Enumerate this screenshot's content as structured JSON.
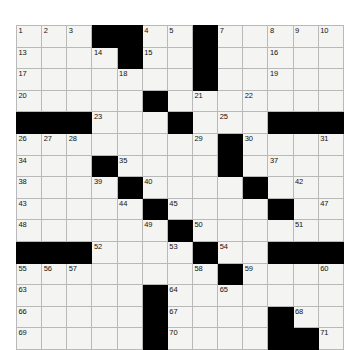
{
  "puzzle": {
    "kind": "crossword-grid",
    "title": "Crossword Puzzle Grid",
    "columns": 13,
    "rows": 15,
    "colors": {
      "block": "#000000",
      "cell": "#f4f4f2",
      "gridline": "#b9b9b9",
      "number": "#111111",
      "page_background": "#ffffff"
    },
    "legend": {
      "white_cell": ".",
      "black_cell": "#"
    },
    "grid": [
      "...##....#.....",
      "....#...#.....",
      ".....#..#.....",
      ".....#.......",
      "###....#.....",
      "........#....",
      "...#.....#...",
      "...##........",
      "....#....#.#.",
      "....#.#......",
      "###...#.#....",
      "......#.#....",
      ".....#.......",
      ".....#....#..",
      ".....#....##."
    ],
    "grid_rows": [
      {
        "row": 1,
        "blocks": [
          4,
          5,
          8
        ]
      },
      {
        "row": 2,
        "blocks": [
          5,
          8
        ]
      },
      {
        "row": 3,
        "blocks": [
          8
        ]
      },
      {
        "row": 4,
        "blocks": [
          6
        ]
      },
      {
        "row": 5,
        "blocks": [
          1,
          2,
          3,
          7,
          11,
          12,
          13
        ]
      },
      {
        "row": 6,
        "blocks": [
          9
        ]
      },
      {
        "row": 7,
        "blocks": [
          4,
          9
        ]
      },
      {
        "row": 8,
        "blocks": [
          5,
          10
        ]
      },
      {
        "row": 9,
        "blocks": [
          6,
          11
        ]
      },
      {
        "row": 10,
        "blocks": [
          7
        ]
      },
      {
        "row": 11,
        "blocks": [
          1,
          2,
          3,
          8,
          11,
          12,
          13
        ]
      },
      {
        "row": 12,
        "blocks": [
          9
        ]
      },
      {
        "row": 13,
        "blocks": [
          6
        ]
      },
      {
        "row": 14,
        "blocks": [
          6,
          11
        ]
      },
      {
        "row": 15,
        "blocks": [
          6,
          11,
          12
        ]
      }
    ],
    "numbers": [
      {
        "n": 1,
        "row": 1,
        "col": 1
      },
      {
        "n": 2,
        "row": 1,
        "col": 2
      },
      {
        "n": 3,
        "row": 1,
        "col": 3
      },
      {
        "n": 4,
        "row": 1,
        "col": 6
      },
      {
        "n": 5,
        "row": 1,
        "col": 7
      },
      {
        "n": 6,
        "row": 1,
        "col": 8
      },
      {
        "n": 7,
        "row": 1,
        "col": 9
      },
      {
        "n": 8,
        "row": 1,
        "col": 11
      },
      {
        "n": 9,
        "row": 1,
        "col": 12
      },
      {
        "n": 10,
        "row": 1,
        "col": 13
      },
      {
        "n": 11,
        "row": 1,
        "col": 14
      },
      {
        "n": 12,
        "row": 1,
        "col": 15
      },
      {
        "n": 13,
        "row": 2,
        "col": 1
      },
      {
        "n": 14,
        "row": 2,
        "col": 4
      },
      {
        "n": 15,
        "row": 2,
        "col": 6
      },
      {
        "n": 16,
        "row": 2,
        "col": 11
      },
      {
        "n": 17,
        "row": 3,
        "col": 1
      },
      {
        "n": 18,
        "row": 3,
        "col": 5
      },
      {
        "n": 19,
        "row": 3,
        "col": 11
      },
      {
        "n": 20,
        "row": 4,
        "col": 1
      },
      {
        "n": 21,
        "row": 4,
        "col": 8
      },
      {
        "n": 22,
        "row": 4,
        "col": 10
      },
      {
        "n": 23,
        "row": 5,
        "col": 4
      },
      {
        "n": 24,
        "row": 5,
        "col": 7
      },
      {
        "n": 25,
        "row": 5,
        "col": 9
      },
      {
        "n": 26,
        "row": 6,
        "col": 1
      },
      {
        "n": 27,
        "row": 6,
        "col": 2
      },
      {
        "n": 28,
        "row": 6,
        "col": 3
      },
      {
        "n": 29,
        "row": 6,
        "col": 8
      },
      {
        "n": 30,
        "row": 6,
        "col": 10
      },
      {
        "n": 31,
        "row": 6,
        "col": 13
      },
      {
        "n": 32,
        "row": 6,
        "col": 14
      },
      {
        "n": 33,
        "row": 6,
        "col": 15
      },
      {
        "n": 34,
        "row": 7,
        "col": 1
      },
      {
        "n": 35,
        "row": 7,
        "col": 5
      },
      {
        "n": 36,
        "row": 7,
        "col": 9
      },
      {
        "n": 37,
        "row": 7,
        "col": 11
      },
      {
        "n": 38,
        "row": 8,
        "col": 1
      },
      {
        "n": 39,
        "row": 8,
        "col": 4
      },
      {
        "n": 40,
        "row": 8,
        "col": 6
      },
      {
        "n": 41,
        "row": 8,
        "col": 10
      },
      {
        "n": 42,
        "row": 8,
        "col": 12
      },
      {
        "n": 43,
        "row": 9,
        "col": 1
      },
      {
        "n": 44,
        "row": 9,
        "col": 5
      },
      {
        "n": 45,
        "row": 9,
        "col": 7
      },
      {
        "n": 46,
        "row": 9,
        "col": 11
      },
      {
        "n": 47,
        "row": 9,
        "col": 13
      },
      {
        "n": 48,
        "row": 10,
        "col": 1
      },
      {
        "n": 49,
        "row": 10,
        "col": 6
      },
      {
        "n": 50,
        "row": 10,
        "col": 8
      },
      {
        "n": 51,
        "row": 10,
        "col": 12
      },
      {
        "n": 52,
        "row": 11,
        "col": 4
      },
      {
        "n": 53,
        "row": 11,
        "col": 7
      },
      {
        "n": 54,
        "row": 11,
        "col": 9
      },
      {
        "n": 55,
        "row": 12,
        "col": 1
      },
      {
        "n": 56,
        "row": 12,
        "col": 2
      },
      {
        "n": 57,
        "row": 12,
        "col": 3
      },
      {
        "n": 58,
        "row": 12,
        "col": 8
      },
      {
        "n": 59,
        "row": 12,
        "col": 10
      },
      {
        "n": 60,
        "row": 12,
        "col": 13
      },
      {
        "n": 61,
        "row": 12,
        "col": 14
      },
      {
        "n": 62,
        "row": 12,
        "col": 15
      },
      {
        "n": 63,
        "row": 13,
        "col": 1
      },
      {
        "n": 64,
        "row": 13,
        "col": 7
      },
      {
        "n": 65,
        "row": 13,
        "col": 9
      },
      {
        "n": 66,
        "row": 14,
        "col": 1
      },
      {
        "n": 67,
        "row": 14,
        "col": 7
      },
      {
        "n": 68,
        "row": 14,
        "col": 12
      },
      {
        "n": 69,
        "row": 15,
        "col": 1
      },
      {
        "n": 70,
        "row": 15,
        "col": 7
      },
      {
        "n": 71,
        "row": 15,
        "col": 13
      }
    ]
  }
}
